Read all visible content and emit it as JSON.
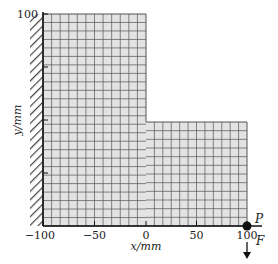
{
  "figure": {
    "type": "finite-element mesh of L-shaped cantilever plate",
    "axes": {
      "x_label": "x/mm",
      "y_label": "y/mm",
      "x_ticks": [
        "−100",
        "−50",
        "0",
        "50",
        "100"
      ],
      "y_ticks": [
        "100"
      ]
    },
    "annotations": {
      "point_label": "P",
      "force_label": "F"
    },
    "colors": {
      "mesh_fill": "#e3e3e3",
      "mesh_lines": "#555555",
      "outline": "#111111",
      "hatch": "#444444"
    },
    "mesh": {
      "vertical_arm": {
        "cols": 12,
        "rows": 25
      },
      "horizontal_arm": {
        "cols": 12,
        "rows": 12
      }
    }
  }
}
